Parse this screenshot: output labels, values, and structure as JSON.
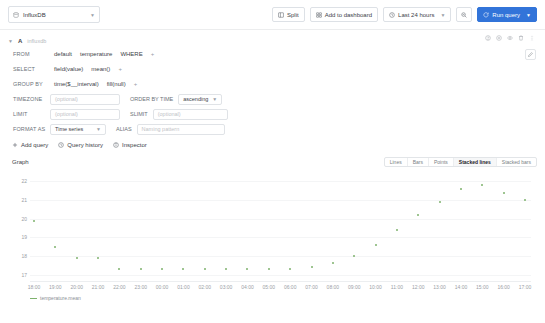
{
  "toolbar": {
    "datasource": "InfluxDB",
    "split_label": "Split",
    "add_to_dashboard_label": "Add to dashboard",
    "time_range_label": "Last 24 hours",
    "run_query_label": "Run query"
  },
  "query": {
    "letter": "A",
    "datasource_hint": "influxdb",
    "rows": {
      "from": {
        "label": "FROM",
        "policy": "default",
        "measurement": "temperature",
        "where": "WHERE",
        "add": "+"
      },
      "select": {
        "label": "SELECT",
        "field": "field(value)",
        "aggregate": "mean()",
        "add": "+"
      },
      "group_by": {
        "label": "GROUP BY",
        "time": "time($__interval)",
        "fill": "fill(null)",
        "add": "+"
      },
      "timezone": {
        "label": "TIMEZONE",
        "placeholder": "(optional)",
        "value": "",
        "order_by_label": "ORDER BY TIME",
        "order_by_value": "ascending"
      },
      "limit": {
        "label": "LIMIT",
        "placeholder": "(optional)",
        "value": "",
        "slimit_label": "SLIMIT",
        "slimit_placeholder": "(optional)",
        "slimit_value": ""
      },
      "format_as": {
        "label": "FORMAT AS",
        "value": "Time series",
        "alias_label": "ALIAS",
        "alias_placeholder": "Naming pattern",
        "alias_value": ""
      }
    }
  },
  "actions": {
    "add_query_label": "Add query",
    "query_history_label": "Query history",
    "inspector_label": "Inspector"
  },
  "panel": {
    "title": "Graph",
    "graph_types": [
      {
        "label": "Lines",
        "active": false
      },
      {
        "label": "Bars",
        "active": false
      },
      {
        "label": "Points",
        "active": false
      },
      {
        "label": "Stacked lines",
        "active": true
      },
      {
        "label": "Stacked bars",
        "active": false
      }
    ]
  },
  "chart_data": {
    "type": "scatter",
    "title": "Graph",
    "xlabel": "",
    "ylabel": "",
    "ylim": [
      16.6,
      22.4
    ],
    "yticks": [
      22,
      21,
      20,
      19,
      18,
      17
    ],
    "grid": true,
    "legend_position": "bottom-left",
    "series": [
      {
        "name": "temperature.mean",
        "color": "#7eb26d",
        "x": [
          "18:00",
          "19:00",
          "20:00",
          "21:00",
          "22:00",
          "23:00",
          "00:00",
          "01:00",
          "02:00",
          "03:00",
          "04:00",
          "05:00",
          "06:00",
          "07:00",
          "08:00",
          "09:00",
          "10:00",
          "11:00",
          "12:00",
          "13:00",
          "14:00",
          "15:00",
          "16:00",
          "17:00"
        ],
        "values": [
          19.9,
          18.5,
          17.9,
          17.9,
          17.3,
          17.3,
          17.3,
          17.3,
          17.3,
          17.3,
          17.3,
          17.3,
          17.3,
          17.4,
          17.6,
          18.0,
          18.6,
          19.4,
          20.2,
          20.9,
          21.6,
          21.8,
          21.4,
          21.0
        ]
      }
    ],
    "xtick_labels": [
      "18:00",
      "19:00",
      "20:00",
      "21:00",
      "22:00",
      "23:00",
      "00:00",
      "01:00",
      "02:00",
      "03:00",
      "04:00",
      "05:00",
      "06:00",
      "07:00",
      "08:00",
      "09:00",
      "10:00",
      "11:00",
      "12:00",
      "13:00",
      "14:00",
      "15:00",
      "16:00",
      "17:00"
    ]
  }
}
